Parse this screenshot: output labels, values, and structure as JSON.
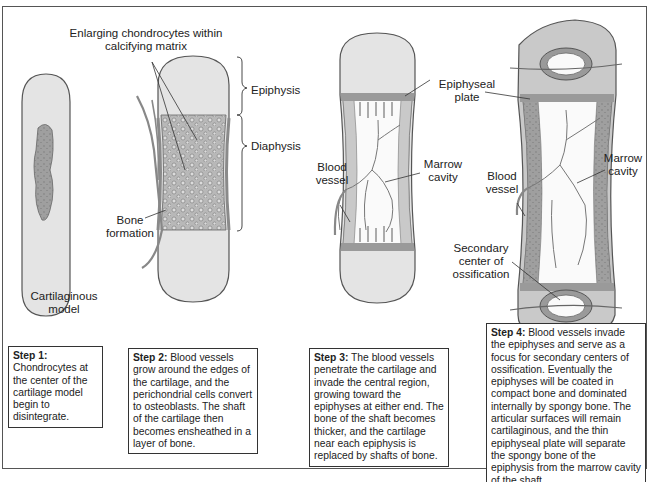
{
  "figure": {
    "colors": {
      "cartilage": "#e4e4e4",
      "cartilage_dark": "#a9a9a9",
      "bone": "#c9c9c9",
      "plate": "#9a9a9a",
      "vessel": "#8a8a8a",
      "outline": "#444444"
    },
    "stage1": {
      "label": "Cartilaginous model"
    },
    "stage2": {
      "labels": {
        "enlarging": "Enlarging chondrocytes within calcifying matrix",
        "epiphysis": "Epiphysis",
        "diaphysis": "Diaphysis",
        "bone_formation": "Bone formation"
      }
    },
    "stage3": {
      "labels": {
        "epiphyseal_plate": "Epiphyseal plate",
        "blood_vessel": "Blood vessel",
        "marrow_cavity": "Marrow cavity"
      }
    },
    "stage4": {
      "labels": {
        "blood_vessel": "Blood vessel",
        "marrow_cavity": "Marrow cavity",
        "secondary_center": "Secondary center of ossification"
      }
    },
    "steps": [
      {
        "title": "Step 1:",
        "text": "Chondrocytes at the center of the cartilage model begin to disintegrate."
      },
      {
        "title": "Step 2:",
        "text": "Blood vessels grow around the edges of the cartilage, and the perichondrial cells convert to osteoblasts. The shaft of the cartilage then becomes ensheathed in a layer of bone."
      },
      {
        "title": "Step 3:",
        "text": "The blood vessels penetrate the cartilage and invade the central region, growing toward the epiphyses at either end. The bone of the shaft becomes thicker, and the cartilage near each epiphysis is replaced by shafts of bone."
      },
      {
        "title": "Step 4:",
        "text": "Blood vessels invade the epiphyses and serve as a focus for secondary centers of ossification. Eventually the epiphyses will be coated in compact bone and dominated internally by spongy bone. The articular surfaces will remain cartilaginous, and the thin epiphyseal plate will separate the spongy bone of the epiphysis from the marrow cavity of the shaft."
      }
    ]
  }
}
